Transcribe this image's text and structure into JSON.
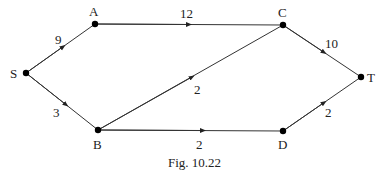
{
  "figure": {
    "caption": "Fig. 10.22",
    "nodes": [
      {
        "id": "S",
        "label": "S",
        "x": 26,
        "y": 73
      },
      {
        "id": "A",
        "label": "A",
        "x": 95,
        "y": 24
      },
      {
        "id": "C",
        "label": "C",
        "x": 283,
        "y": 25
      },
      {
        "id": "T",
        "label": "T",
        "x": 361,
        "y": 77
      },
      {
        "id": "B",
        "label": "B",
        "x": 98,
        "y": 130
      },
      {
        "id": "D",
        "label": "D",
        "x": 283,
        "y": 131
      }
    ],
    "edges": [
      {
        "from": "S",
        "to": "A",
        "weight": "9"
      },
      {
        "from": "S",
        "to": "B",
        "weight": "3"
      },
      {
        "from": "A",
        "to": "C",
        "weight": "12"
      },
      {
        "from": "B",
        "to": "C",
        "weight": "2"
      },
      {
        "from": "B",
        "to": "D",
        "weight": "2"
      },
      {
        "from": "C",
        "to": "T",
        "weight": "10"
      },
      {
        "from": "D",
        "to": "T",
        "weight": "2"
      }
    ],
    "colors": {
      "line": "#333333",
      "node": "#000000",
      "text": "#222222"
    }
  }
}
